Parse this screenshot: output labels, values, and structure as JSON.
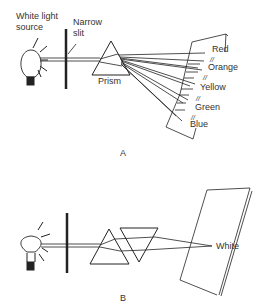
{
  "diagram_a": {
    "caption": "A",
    "labels": {
      "source_line1": "White light",
      "source_line2": "source",
      "slit_line1": "Narrow",
      "slit_line2": "slit",
      "prism": "Prism"
    },
    "spectrum": [
      "Red",
      "Orange",
      "Yellow",
      "Green",
      "Blue"
    ],
    "separator": "//"
  },
  "diagram_b": {
    "caption": "B",
    "result": "White"
  }
}
